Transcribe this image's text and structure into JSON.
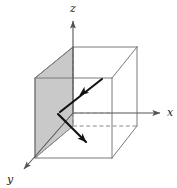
{
  "figure": {
    "width": 177,
    "height": 188,
    "background_color": "#ffffff"
  },
  "colors": {
    "axis_line": "#555555",
    "cube_line": "#7a7a7a",
    "hidden_edge": "#8a8a8a",
    "shaded_plane_fill": "#c9c9c9",
    "shaded_plane_stroke": "#6e6e6e",
    "vector_stroke": "#111111",
    "label_text": "#1a1a1a"
  },
  "axes": [
    {
      "name": "z-axis",
      "label": "z",
      "direction": "up",
      "label_x": 73,
      "label_y": 12,
      "line": {
        "x1": 73,
        "y1": 113,
        "x2": 73,
        "y2": 21
      },
      "arrow_tip_x": 73,
      "arrow_tip_y": 18
    },
    {
      "name": "x-axis",
      "label": "x",
      "direction": "right",
      "label_x": 170,
      "label_y": 116,
      "line": {
        "x1": 73,
        "y1": 113,
        "x2": 160,
        "y2": 113
      },
      "arrow_tip_x": 164,
      "arrow_tip_y": 113
    },
    {
      "name": "y-axis",
      "label": "y",
      "direction": "down-left",
      "label_x": 10,
      "label_y": 183,
      "line": {
        "x1": 73,
        "y1": 113,
        "x2": 24,
        "y2": 169
      },
      "arrow_tip_x": 19,
      "arrow_tip_y": 175
    }
  ],
  "cube": {
    "name": "unit-cube",
    "front_face": [
      {
        "x": 35,
        "y": 78
      },
      {
        "x": 112,
        "y": 78
      },
      {
        "x": 112,
        "y": 158
      },
      {
        "x": 35,
        "y": 158
      }
    ],
    "back_face": [
      {
        "x": 73,
        "y": 47
      },
      {
        "x": 137,
        "y": 47
      },
      {
        "x": 137,
        "y": 126
      },
      {
        "x": 73,
        "y": 126
      }
    ],
    "visible_edges": [
      {
        "x1": 35,
        "y1": 78,
        "x2": 112,
        "y2": 78
      },
      {
        "x1": 112,
        "y1": 78,
        "x2": 112,
        "y2": 158
      },
      {
        "x1": 112,
        "y1": 158,
        "x2": 35,
        "y2": 158
      },
      {
        "x1": 35,
        "y1": 158,
        "x2": 35,
        "y2": 78
      },
      {
        "x1": 35,
        "y1": 78,
        "x2": 73,
        "y2": 47
      },
      {
        "x1": 112,
        "y1": 78,
        "x2": 137,
        "y2": 47
      },
      {
        "x1": 112,
        "y1": 158,
        "x2": 137,
        "y2": 126
      },
      {
        "x1": 73,
        "y1": 47,
        "x2": 137,
        "y2": 47
      },
      {
        "x1": 137,
        "y1": 47,
        "x2": 137,
        "y2": 126
      }
    ],
    "hidden_edges": [
      {
        "x1": 73,
        "y1": 47,
        "x2": 73,
        "y2": 126
      },
      {
        "x1": 73,
        "y1": 126,
        "x2": 137,
        "y2": 126
      },
      {
        "x1": 35,
        "y1": 158,
        "x2": 73,
        "y2": 126
      }
    ]
  },
  "shaded_plane": {
    "name": "shaded-cross-section",
    "fill": "#c9c9c9",
    "vertices": [
      {
        "x": 35,
        "y": 78
      },
      {
        "x": 73,
        "y": 47
      },
      {
        "x": 73,
        "y": 126
      },
      {
        "x": 35,
        "y": 158
      }
    ]
  },
  "vectors": [
    {
      "name": "upper-vector",
      "description": "arrow pointing down-left toward origin vertex",
      "tail_x": 102,
      "tail_y": 79,
      "head_x": 60,
      "head_y": 112,
      "arrowhead_x": 80,
      "arrowhead_y": 95
    },
    {
      "name": "lower-vector",
      "description": "arrow pointing down-right away from vertex",
      "tail_x": 58,
      "tail_y": 114,
      "head_x": 86,
      "head_y": 142,
      "arrowhead_x": 86,
      "arrowhead_y": 142
    }
  ]
}
